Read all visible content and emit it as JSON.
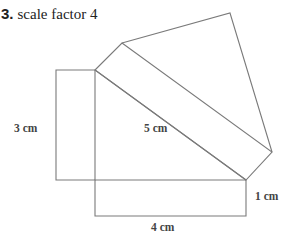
{
  "question": {
    "number": "3.",
    "text": "scale factor 4"
  },
  "diagram": {
    "line_color": "#7a7a7a",
    "labels": {
      "left_side": "3 cm",
      "hypotenuse": "5 cm",
      "right_side": "1 cm",
      "bottom_side": "4 cm"
    }
  }
}
